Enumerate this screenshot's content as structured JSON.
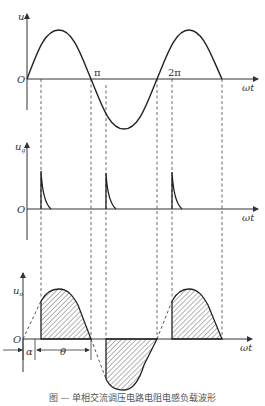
{
  "figure": {
    "panel_top": {
      "y_label": "u",
      "x_label": "ωt",
      "origin_label": "O",
      "tick_labels": [
        "π",
        "2π"
      ],
      "signal": "sine wave input voltage, two cycles"
    },
    "panel_middle": {
      "y_label": "u",
      "y_label_sub": "g",
      "x_label": "ωt",
      "origin_label": "O",
      "signal": "gate trigger pulses at α, π+α, 2π+α"
    },
    "panel_bottom": {
      "y_label": "u",
      "y_label_sub": "o",
      "x_label": "ωt",
      "origin_label": "O",
      "alpha_label": "α",
      "theta_label": "θ",
      "signal": "output voltage, hatched conduction regions"
    },
    "caption": "图 — 单相交流调压电路电阻电感负载波形"
  },
  "colors": {
    "curve": "#222222",
    "axis": "#333333",
    "dashed": "#444444",
    "hatch": "#555555"
  }
}
